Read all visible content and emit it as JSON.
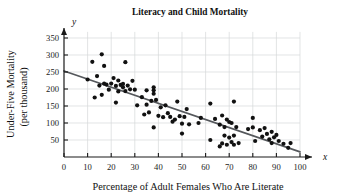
{
  "chart_data": {
    "type": "scatter",
    "title": "Literacy and Child Mortality",
    "xlabel": "Percentage of Adult Females Who Are Literate",
    "ylabel": "Under-Five Mortality (per thousand)",
    "ylabel_line1": "Under-Five Mortality",
    "ylabel_line2": "(per thousand)",
    "x_axis_name": "x",
    "y_axis_name": "y",
    "xlim": [
      0,
      100
    ],
    "ylim": [
      0,
      375
    ],
    "xticks": [
      0,
      10,
      20,
      30,
      40,
      50,
      60,
      70,
      80,
      90,
      100
    ],
    "yticks": [
      50,
      100,
      150,
      200,
      250,
      300,
      350
    ],
    "grid": true,
    "legend": null,
    "point_color": "#111111",
    "trendline_color": "#55585c",
    "grid_color": "#d6d8da",
    "axis_color": "#1a1a1a",
    "trendline": {
      "label": "least-squares regression line",
      "x_start": 0,
      "y_start": 253,
      "x_end": 100,
      "y_end": 15,
      "slope": -2.38,
      "intercept": 253
    },
    "points": [
      [
        10,
        228
      ],
      [
        12,
        280
      ],
      [
        13,
        175
      ],
      [
        14,
        238
      ],
      [
        15,
        210
      ],
      [
        16,
        302
      ],
      [
        16,
        183
      ],
      [
        17,
        268
      ],
      [
        17,
        216
      ],
      [
        18,
        213
      ],
      [
        19,
        198
      ],
      [
        20,
        216
      ],
      [
        21,
        232
      ],
      [
        22,
        160
      ],
      [
        22,
        209
      ],
      [
        23,
        193
      ],
      [
        23,
        225
      ],
      [
        24,
        212
      ],
      [
        25,
        205
      ],
      [
        25,
        215
      ],
      [
        26,
        279
      ],
      [
        26,
        194
      ],
      [
        27,
        210
      ],
      [
        28,
        199
      ],
      [
        29,
        224
      ],
      [
        30,
        198
      ],
      [
        31,
        152
      ],
      [
        33,
        176
      ],
      [
        34,
        125
      ],
      [
        35,
        154
      ],
      [
        35,
        196
      ],
      [
        36,
        131
      ],
      [
        37,
        165
      ],
      [
        38,
        205
      ],
      [
        38,
        196
      ],
      [
        38,
        186
      ],
      [
        38,
        87
      ],
      [
        39,
        168
      ],
      [
        40,
        121
      ],
      [
        41,
        146
      ],
      [
        42,
        117
      ],
      [
        43,
        152
      ],
      [
        44,
        129
      ],
      [
        45,
        118
      ],
      [
        46,
        104
      ],
      [
        47,
        110
      ],
      [
        48,
        163
      ],
      [
        49,
        120
      ],
      [
        50,
        98
      ],
      [
        50,
        69
      ],
      [
        51,
        118
      ],
      [
        52,
        141
      ],
      [
        53,
        96
      ],
      [
        57,
        100
      ],
      [
        58,
        115
      ],
      [
        62,
        157
      ],
      [
        62,
        50
      ],
      [
        64,
        112
      ],
      [
        66,
        95
      ],
      [
        66,
        31
      ],
      [
        67,
        122
      ],
      [
        67,
        40
      ],
      [
        68,
        63
      ],
      [
        68,
        88
      ],
      [
        69,
        110
      ],
      [
        69,
        36
      ],
      [
        70,
        103
      ],
      [
        70,
        57
      ],
      [
        71,
        100
      ],
      [
        71,
        44
      ],
      [
        72,
        163
      ],
      [
        72,
        63
      ],
      [
        72,
        36
      ],
      [
        73,
        88
      ],
      [
        74,
        41
      ],
      [
        78,
        82
      ],
      [
        80,
        115
      ],
      [
        80,
        87
      ],
      [
        81,
        47
      ],
      [
        83,
        79
      ],
      [
        84,
        60
      ],
      [
        85,
        85
      ],
      [
        86,
        68
      ],
      [
        87,
        52
      ],
      [
        88,
        74
      ],
      [
        88,
        41
      ],
      [
        89,
        58
      ],
      [
        90,
        65
      ],
      [
        91,
        47
      ],
      [
        93,
        39
      ],
      [
        95,
        27
      ],
      [
        96,
        41
      ]
    ]
  }
}
